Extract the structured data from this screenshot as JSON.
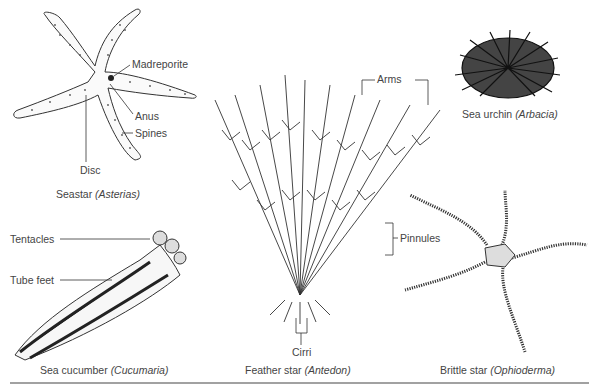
{
  "figure": {
    "organisms": [
      {
        "id": "seastar",
        "common": "Seastar",
        "genus": "(Asterias)",
        "labels": [
          "Madreporite",
          "Anus",
          "Spines",
          "Disc"
        ]
      },
      {
        "id": "feather-star",
        "common": "Feather star",
        "genus": "(Antedon)",
        "labels": [
          "Arms",
          "Pinnules",
          "Cirri"
        ]
      },
      {
        "id": "sea-urchin",
        "common": "Sea urchin",
        "genus": "(Arbacia)",
        "labels": []
      },
      {
        "id": "sea-cucumber",
        "common": "Sea cucumber",
        "genus": "(Cucumaria)",
        "labels": [
          "Tentacles",
          "Tube feet"
        ]
      },
      {
        "id": "brittle-star",
        "common": "Brittle star",
        "genus": "(Ophioderma)",
        "labels": []
      }
    ]
  }
}
